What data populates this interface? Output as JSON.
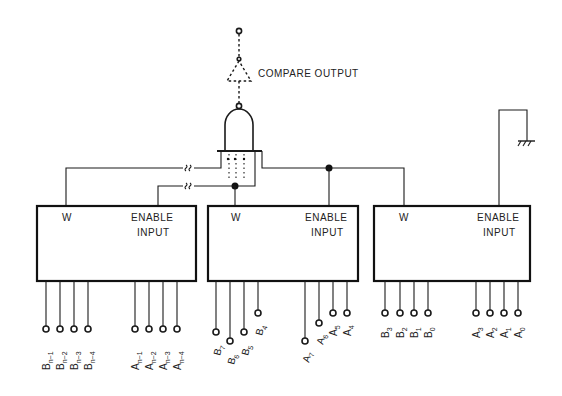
{
  "diagram": {
    "output_label": "COMPARE OUTPUT",
    "blocks": [
      {
        "id": "block-msb",
        "w_label": "W",
        "enable_label_line1": "ENABLE",
        "enable_label_line2": "INPUT",
        "b_pins": [
          {
            "base": "B",
            "sub": "n−1"
          },
          {
            "base": "B",
            "sub": "n−2"
          },
          {
            "base": "B",
            "sub": "n−3"
          },
          {
            "base": "B",
            "sub": "n−4"
          }
        ],
        "a_pins": [
          {
            "base": "A",
            "sub": "n−1"
          },
          {
            "base": "A",
            "sub": "n−2"
          },
          {
            "base": "A",
            "sub": "n−3"
          },
          {
            "base": "A",
            "sub": "n−4"
          }
        ]
      },
      {
        "id": "block-mid",
        "w_label": "W",
        "enable_label_line1": "ENABLE",
        "enable_label_line2": "INPUT",
        "b_pins": [
          {
            "base": "B",
            "sub": "7"
          },
          {
            "base": "B",
            "sub": "6"
          },
          {
            "base": "B",
            "sub": "5"
          },
          {
            "base": "B",
            "sub": "4"
          }
        ],
        "a_pins": [
          {
            "base": "A",
            "sub": "7"
          },
          {
            "base": "A",
            "sub": "6"
          },
          {
            "base": "A",
            "sub": "5"
          },
          {
            "base": "A",
            "sub": "4"
          }
        ]
      },
      {
        "id": "block-lsb",
        "w_label": "W",
        "enable_label_line1": "ENABLE",
        "enable_label_line2": "INPUT",
        "b_pins": [
          {
            "base": "B",
            "sub": "3"
          },
          {
            "base": "B",
            "sub": "2"
          },
          {
            "base": "B",
            "sub": "1"
          },
          {
            "base": "B",
            "sub": "0"
          }
        ],
        "a_pins": [
          {
            "base": "A",
            "sub": "3"
          },
          {
            "base": "A",
            "sub": "2"
          },
          {
            "base": "A",
            "sub": "1"
          },
          {
            "base": "A",
            "sub": "0"
          }
        ]
      }
    ],
    "symbols": [
      "nand-gate",
      "buffer-triangle-dashed",
      "ground-symbol",
      "wire-break-symbol"
    ],
    "colors": {
      "ink": "#1a1a1a",
      "background": "#ffffff"
    }
  }
}
